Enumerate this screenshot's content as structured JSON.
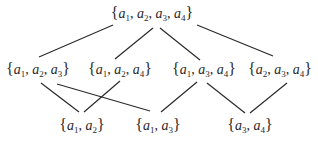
{
  "diagram": {
    "type": "hasse-diagram",
    "nodes": [
      {
        "id": "n1234",
        "elements": [
          "1",
          "2",
          "3",
          "4"
        ],
        "x": 152,
        "y": 14
      },
      {
        "id": "n123",
        "elements": [
          "1",
          "2",
          "3"
        ],
        "x": 38,
        "y": 70
      },
      {
        "id": "n124",
        "elements": [
          "1",
          "2",
          "4"
        ],
        "x": 120,
        "y": 70
      },
      {
        "id": "n134",
        "elements": [
          "1",
          "3",
          "4"
        ],
        "x": 204,
        "y": 70
      },
      {
        "id": "n234",
        "elements": [
          "2",
          "3",
          "4"
        ],
        "x": 280,
        "y": 70
      },
      {
        "id": "n12",
        "elements": [
          "1",
          "2"
        ],
        "x": 82,
        "y": 126
      },
      {
        "id": "n13",
        "elements": [
          "1",
          "3"
        ],
        "x": 158,
        "y": 126
      },
      {
        "id": "n34",
        "elements": [
          "3",
          "4"
        ],
        "x": 250,
        "y": 126
      }
    ],
    "edges": [
      {
        "from": "n1234",
        "to": "n123",
        "x1": 113,
        "y1": 25,
        "x2": 39,
        "y2": 57
      },
      {
        "from": "n1234",
        "to": "n124",
        "x1": 153,
        "y1": 28,
        "x2": 115,
        "y2": 59
      },
      {
        "from": "n1234",
        "to": "n134",
        "x1": 160,
        "y1": 28,
        "x2": 200,
        "y2": 60
      },
      {
        "from": "n1234",
        "to": "n234",
        "x1": 197,
        "y1": 25,
        "x2": 273,
        "y2": 56
      },
      {
        "from": "n123",
        "to": "n12",
        "x1": 41,
        "y1": 83,
        "x2": 79,
        "y2": 112
      },
      {
        "from": "n123",
        "to": "n13",
        "x1": 57,
        "y1": 84,
        "x2": 150,
        "y2": 111
      },
      {
        "from": "n124",
        "to": "n12",
        "x1": 120,
        "y1": 81,
        "x2": 84,
        "y2": 112
      },
      {
        "from": "n134",
        "to": "n13",
        "x1": 197,
        "y1": 82,
        "x2": 161,
        "y2": 112
      },
      {
        "from": "n134",
        "to": "n34",
        "x1": 207,
        "y1": 83,
        "x2": 245,
        "y2": 113
      },
      {
        "from": "n234",
        "to": "n34",
        "x1": 287,
        "y1": 83,
        "x2": 250,
        "y2": 113
      }
    ],
    "variable_symbol": "a",
    "line_color": "#2a2a2a",
    "text_color": "#2a2a2a"
  }
}
